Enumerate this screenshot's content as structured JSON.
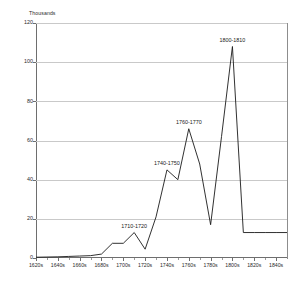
{
  "chart_data": {
    "type": "line",
    "title": "",
    "subtitle": "",
    "xlabel": "",
    "ylabel": "Thousands",
    "unit_caption": "Thousands",
    "ylim": [
      0,
      120
    ],
    "ytick_labels": [
      "0",
      "20",
      "40",
      "60",
      "80",
      "100",
      "120"
    ],
    "ytick_values": [
      0,
      20,
      40,
      60,
      80,
      100,
      120
    ],
    "grid": true,
    "grid_axis": "y",
    "legend": false,
    "legend_position": "none",
    "line_color": "#1a1a1a",
    "grid_color": "#c9c9c9",
    "axis_color": "#6e6e6e",
    "background_color": "#ffffff",
    "xtick_labels": [
      "1620s",
      "1640s",
      "1660s",
      "1680s",
      "1700s",
      "1720s",
      "1740s",
      "1760s",
      "1780s",
      "1800s",
      "1820s",
      "1840s"
    ],
    "xtick_values": [
      1620,
      1640,
      1660,
      1680,
      1700,
      1720,
      1740,
      1760,
      1780,
      1800,
      1820,
      1840
    ],
    "categories": [
      "1620s",
      "1630s",
      "1640s",
      "1650s",
      "1660s",
      "1670s",
      "1680s",
      "1690s",
      "1700s",
      "1710s",
      "1720s",
      "1730s",
      "1740s",
      "1750s",
      "1760s",
      "1770s",
      "1780s",
      "1790s",
      "1800s",
      "1810s",
      "1820s",
      "1830s",
      "1840s"
    ],
    "x": [
      1620,
      1630,
      1640,
      1650,
      1660,
      1670,
      1680,
      1690,
      1700,
      1710,
      1720,
      1730,
      1740,
      1750,
      1760,
      1770,
      1780,
      1790,
      1800,
      1810,
      1820,
      1830,
      1840
    ],
    "values": [
      0.4,
      0.5,
      0.6,
      0.8,
      1.0,
      1.2,
      2.0,
      7.5,
      7.5,
      13.0,
      4.5,
      21.0,
      45.0,
      40.0,
      66.0,
      48.0,
      17.0,
      62.0,
      108.0,
      13.0,
      13.0,
      13.0,
      13.0
    ],
    "annotations": [
      {
        "label": "1710-1720",
        "x": 1710,
        "y": 13.0
      },
      {
        "label": "1740-1750",
        "x": 1740,
        "y": 45.0
      },
      {
        "label": "1760-1770",
        "x": 1760,
        "y": 66.0
      },
      {
        "label": "1800-1810",
        "x": 1800,
        "y": 108.0
      }
    ]
  }
}
